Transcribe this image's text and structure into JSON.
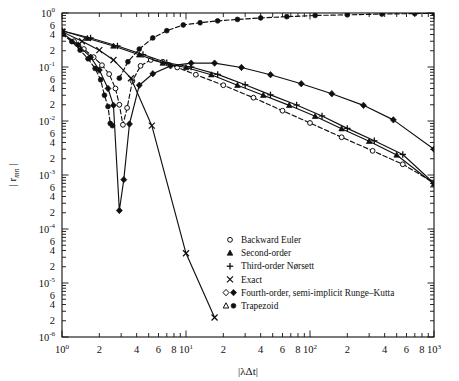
{
  "chart_data": {
    "type": "line",
    "title": "",
    "xlabel": "|λΔt|",
    "ylabel": "| r_mn |",
    "ylabel_display": "|r",
    "ylabel_sub": "mn",
    "ylabel_tail": "|",
    "xscale": "log",
    "yscale": "log",
    "xlim": [
      1,
      1000
    ],
    "ylim": [
      1e-06,
      1
    ],
    "grid": false,
    "legend_position": "inside-lower-right",
    "x_major_ticks": [
      "10^0",
      "10^1",
      "10^2",
      "10^3"
    ],
    "x_major_values": [
      1,
      10,
      100,
      1000
    ],
    "x_minor_labels": [
      "2",
      "4",
      "6",
      "8"
    ],
    "x_minor_label_mantissas": [
      2,
      4,
      6,
      8
    ],
    "y_major_ticks": [
      "10^0",
      "10^-1",
      "10^-2",
      "10^-3",
      "10^-4",
      "10^-5",
      "10^-6"
    ],
    "y_major_values": [
      1,
      0.1,
      0.01,
      0.001,
      0.0001,
      1e-05,
      1e-06
    ],
    "y_minor_labels": [
      "6",
      "4",
      "2"
    ],
    "y_minor_label_mantissas": [
      6,
      4,
      2
    ],
    "series": [
      {
        "name": "Backward Euler",
        "marker": "open-circle",
        "linestyle": "dashed",
        "points": [
          [
            1.0,
            0.4
          ],
          [
            1.25,
            0.3
          ],
          [
            1.5,
            0.215
          ],
          [
            1.8,
            0.152
          ],
          [
            2.1,
            0.108
          ],
          [
            2.4,
            0.074
          ],
          [
            2.7,
            0.04
          ],
          [
            2.9,
            0.02
          ],
          [
            3.1,
            0.0085
          ],
          [
            3.35,
            0.0175
          ],
          [
            3.7,
            0.055
          ],
          [
            4.3,
            0.105
          ],
          [
            5.2,
            0.135
          ],
          [
            6.5,
            0.125
          ],
          [
            8.5,
            0.098
          ],
          [
            12.0,
            0.072
          ],
          [
            20.0,
            0.046
          ],
          [
            35.0,
            0.027
          ],
          [
            60.0,
            0.0155
          ],
          [
            100.0,
            0.0092
          ],
          [
            180.0,
            0.005
          ],
          [
            320.0,
            0.0028
          ],
          [
            560.0,
            0.00158
          ],
          [
            1000.0,
            0.00072
          ]
        ]
      },
      {
        "name": "Second-order",
        "marker": "filled-triangle",
        "linestyle": "solid",
        "points": [
          [
            1.0,
            0.47
          ],
          [
            1.6,
            0.34
          ],
          [
            2.6,
            0.245
          ],
          [
            4.2,
            0.168
          ],
          [
            6.5,
            0.118
          ],
          [
            10.0,
            0.098
          ],
          [
            16.0,
            0.072
          ],
          [
            26.0,
            0.046
          ],
          [
            42.0,
            0.03
          ],
          [
            68.0,
            0.0195
          ],
          [
            110.0,
            0.0122
          ],
          [
            180.0,
            0.0072
          ],
          [
            300.0,
            0.0042
          ],
          [
            500.0,
            0.00235
          ],
          [
            1000.0,
            0.00068
          ]
        ]
      },
      {
        "name": "Third-order Nørsett",
        "marker": "plus",
        "linestyle": "solid",
        "points": [
          [
            1.0,
            0.47
          ],
          [
            1.7,
            0.345
          ],
          [
            2.8,
            0.245
          ],
          [
            4.5,
            0.17
          ],
          [
            7.0,
            0.12
          ],
          [
            11.0,
            0.1
          ],
          [
            18.0,
            0.073
          ],
          [
            30.0,
            0.047
          ],
          [
            48.0,
            0.0305
          ],
          [
            78.0,
            0.0198
          ],
          [
            125.0,
            0.0124
          ],
          [
            200.0,
            0.0073
          ],
          [
            330.0,
            0.0043
          ],
          [
            560.0,
            0.0024
          ],
          [
            1000.0,
            0.0007
          ]
        ]
      },
      {
        "name": "Exact",
        "marker": "cross",
        "linestyle": "solid",
        "points": [
          [
            1.0,
            0.45
          ],
          [
            1.45,
            0.3
          ],
          [
            2.0,
            0.205
          ],
          [
            2.6,
            0.135
          ],
          [
            3.6,
            0.062
          ],
          [
            5.3,
            0.0082
          ],
          [
            10.0,
            3.55e-05
          ],
          [
            17.0,
            2.3e-06
          ]
        ]
      },
      {
        "name": "Fourth-order, semi-implicit Runge–Kutta",
        "marker": "open-diamond-filled-diamond",
        "linestyle": "solid",
        "points": [
          [
            1.0,
            0.43
          ],
          [
            1.35,
            0.255
          ],
          [
            1.7,
            0.152
          ],
          [
            2.0,
            0.088
          ],
          [
            2.35,
            0.04
          ],
          [
            2.6,
            0.0195
          ],
          [
            2.9,
            0.00022
          ],
          [
            3.15,
            0.00082
          ],
          [
            3.5,
            0.0088
          ],
          [
            4.2,
            0.046
          ],
          [
            5.4,
            0.075
          ],
          [
            7.5,
            0.105
          ],
          [
            11.0,
            0.118
          ],
          [
            17.0,
            0.118
          ],
          [
            28.0,
            0.098
          ],
          [
            48.0,
            0.072
          ],
          [
            85.0,
            0.049
          ],
          [
            150.0,
            0.032
          ],
          [
            270.0,
            0.0195
          ],
          [
            470.0,
            0.0105
          ],
          [
            1000.0,
            0.003
          ]
        ]
      },
      {
        "name": "Trapezoid",
        "marker": "open-triangle-filled-circle",
        "linestyle": "dashed",
        "points": [
          [
            1.0,
            0.41
          ],
          [
            1.2,
            0.295
          ],
          [
            1.4,
            0.205
          ],
          [
            1.62,
            0.142
          ],
          [
            1.85,
            0.094
          ],
          [
            2.05,
            0.058
          ],
          [
            2.2,
            0.03
          ],
          [
            2.35,
            0.0185
          ],
          [
            2.45,
            0.009
          ],
          [
            2.55,
            0.0082
          ]
        ]
      },
      {
        "name": "Trapezoid upper branch",
        "marker": "filled-circle",
        "linestyle": "dashed",
        "points": [
          [
            2.9,
            0.062
          ],
          [
            3.4,
            0.125
          ],
          [
            4.2,
            0.215
          ],
          [
            5.4,
            0.345
          ],
          [
            7.0,
            0.47
          ],
          [
            9.5,
            0.6
          ],
          [
            13.0,
            0.66
          ],
          [
            18.0,
            0.715
          ],
          [
            26.0,
            0.76
          ],
          [
            40.0,
            0.81
          ],
          [
            65.0,
            0.855
          ],
          [
            110.0,
            0.9
          ],
          [
            200.0,
            0.925
          ],
          [
            380.0,
            0.955
          ],
          [
            700.0,
            0.975
          ],
          [
            1000.0,
            0.985
          ]
        ]
      }
    ],
    "legend": [
      {
        "label": "Backward Euler",
        "marker": "open-circle"
      },
      {
        "label": "Second-order",
        "marker": "filled-triangle"
      },
      {
        "label": "Third-order Nørsett",
        "marker": "plus"
      },
      {
        "label": "Exact",
        "marker": "cross"
      },
      {
        "label": "Fourth-order, semi-implicit Runge–Kutta",
        "marker": "open-diamond-filled-diamond"
      },
      {
        "label": "Trapezoid",
        "marker": "open-triangle-filled-circle"
      }
    ]
  },
  "colors": {
    "ink": "#101010",
    "background": "#ffffff"
  }
}
